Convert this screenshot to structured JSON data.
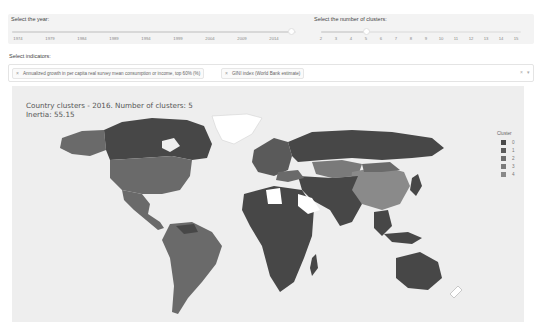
{
  "year_control": {
    "label": "Select the year:",
    "ticks": [
      "1974",
      "1979",
      "1984",
      "1989",
      "1994",
      "1999",
      "2004",
      "2009",
      "2014"
    ],
    "selected": "2016"
  },
  "cluster_control": {
    "label": "Select the number of clusters:",
    "ticks": [
      "2",
      "3",
      "4",
      "5",
      "6",
      "7",
      "8",
      "9",
      "10",
      "11",
      "12",
      "13",
      "14",
      "15"
    ],
    "selected": "5"
  },
  "indicators": {
    "label": "Select indicators:",
    "chips": [
      "Annualized growth in per capita real survey mean consumption or income, top 60% (%)",
      "GINI index (World Bank estimate)"
    ],
    "clear_icon": "×",
    "caret_icon": "▾"
  },
  "map": {
    "title_line1": "Country clusters - 2016. Number of clusters: 5",
    "title_line2": "Inertia: 55.15",
    "legend_title": "Cluster",
    "legend": [
      {
        "label": "0",
        "color": "#4a4a4a"
      },
      {
        "label": "1",
        "color": "#5c5c5c"
      },
      {
        "label": "2",
        "color": "#6e6e6e"
      },
      {
        "label": "3",
        "color": "#7a7a7a"
      },
      {
        "label": "4",
        "color": "#888888"
      }
    ],
    "colors": {
      "cluster_dark": "#474747",
      "cluster_mid": "#6a6a6a",
      "cluster_light": "#8a8a8a",
      "no_data": "#ffffff",
      "background": "#eeeeee"
    }
  }
}
